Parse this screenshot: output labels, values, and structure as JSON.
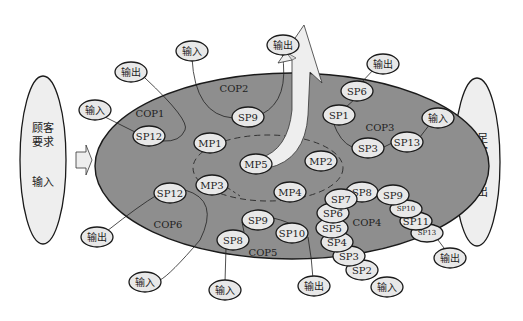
{
  "diagram": {
    "colors": {
      "main_ellipse_fill": "#8e8e8e",
      "bubble_fill": "#e8e8e8",
      "outline": "#1a1a1a",
      "arrow_fill": "#eeeeee",
      "side_ellipse_fill": "#eeeeee"
    },
    "left_side": {
      "title_line1": "顾客",
      "title_line2": "要求",
      "sub": "输入"
    },
    "right_side": {
      "title_line1": "满足",
      "title_line2": "顾客",
      "title_line3": "要求",
      "sub": "输出"
    },
    "cop_labels": {
      "cop1": "COP1",
      "cop2": "COP2",
      "cop3": "COP3",
      "cop4": "COP4",
      "cop5": "COP5",
      "cop6": "COP6"
    },
    "main_processes": {
      "mp1": "MP1",
      "mp2": "MP2",
      "mp3": "MP3",
      "mp4": "MP4",
      "mp5": "MP5"
    },
    "cop1": {
      "sp12": "SP12",
      "input": "输入",
      "output": "输出"
    },
    "cop2": {
      "sp9": "SP9",
      "input": "输入",
      "output": "输出"
    },
    "cop3": {
      "sp6": "SP6",
      "sp1": "SP1",
      "sp3": "SP3",
      "sp13": "SP13",
      "input": "输入",
      "output": "输出"
    },
    "cop4": {
      "chain": [
        "SP8",
        "SP7",
        "SP6",
        "SP5",
        "SP4",
        "SP3",
        "SP2"
      ],
      "branch": [
        "SP9",
        "SP10",
        "SP11",
        "SP13"
      ],
      "input": "输入",
      "output": "输出"
    },
    "cop5": {
      "sp9": "SP9",
      "sp8": "SP8",
      "sp10": "SP10",
      "input": "输入",
      "output": "输出"
    },
    "cop6": {
      "sp12": "SP12",
      "input": "输入",
      "output": "输出"
    }
  }
}
